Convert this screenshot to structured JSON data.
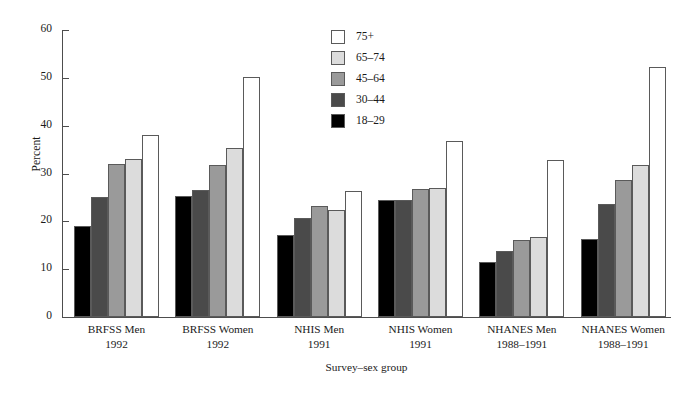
{
  "chart_data": {
    "type": "bar",
    "title": "",
    "subtitle": "",
    "xlabel": "Survey–sex group",
    "ylabel": "Percent",
    "ylim": [
      0,
      60
    ],
    "yticks": [
      0,
      10,
      20,
      30,
      40,
      50,
      60
    ],
    "ytick_labels": [
      "0",
      "10",
      "20",
      "30",
      "40",
      "50",
      "60"
    ],
    "grid": false,
    "legend_position": "top-center",
    "legend_title": "",
    "categories": [
      "BRFSS Men 1992",
      "BRFSS Women 1992",
      "NHIS Men 1991",
      "NHIS Women 1991",
      "NHANES Men 1988–1991",
      "NHANES Women 1988–1991"
    ],
    "category_lines": [
      {
        "line1": "BRFSS Men",
        "line2": "1992"
      },
      {
        "line1": "BRFSS Women",
        "line2": "1992"
      },
      {
        "line1": "NHIS Men",
        "line2": "1991"
      },
      {
        "line1": "NHIS Women",
        "line2": "1991"
      },
      {
        "line1": "NHANES Men",
        "line2": "1988–1991"
      },
      {
        "line1": "NHANES Women",
        "line2": "1988–1991"
      }
    ],
    "series": [
      {
        "name": "18–29",
        "color": "#000000",
        "values": [
          19.0,
          25.2,
          17.1,
          24.4,
          11.6,
          16.4
        ]
      },
      {
        "name": "30–44",
        "color": "#4a4a4a",
        "values": [
          25.0,
          26.5,
          20.6,
          24.5,
          13.8,
          23.7
        ]
      },
      {
        "name": "45–64",
        "color": "#9a9a9a",
        "values": [
          31.9,
          31.7,
          23.3,
          26.7,
          16.2,
          28.6
        ]
      },
      {
        "name": "65–74",
        "color": "#dcdcdc",
        "values": [
          33.1,
          35.3,
          22.3,
          27.0,
          16.7,
          31.8
        ]
      },
      {
        "name": "75+",
        "color": "#ffffff",
        "values": [
          38.0,
          50.2,
          26.4,
          36.9,
          32.8,
          52.3
        ]
      }
    ],
    "legend_order": [
      "75+",
      "65–74",
      "45–64",
      "30–44",
      "18–29"
    ]
  },
  "style": {
    "axis_color": "#4d4d4d",
    "bar_border": "#5a5a5a",
    "background": "#ffffff"
  }
}
